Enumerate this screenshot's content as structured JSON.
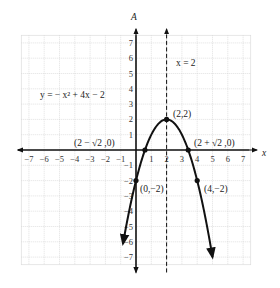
{
  "chart_data": {
    "type": "line",
    "title": "",
    "equation_label": "y = − x² + 4x − 2",
    "xlabel": "x",
    "ylabel": "A",
    "xlim": [
      -7.5,
      7.5
    ],
    "ylim": [
      -7.5,
      7.5
    ],
    "grid": true,
    "x_ticks": [
      -7,
      -6,
      -5,
      -4,
      -3,
      -2,
      -1,
      1,
      2,
      3,
      4,
      5,
      6,
      7
    ],
    "y_ticks": [
      -7,
      -6,
      -5,
      -4,
      -3,
      -2,
      -1,
      1,
      2,
      3,
      4,
      5,
      6,
      7
    ],
    "series": [
      {
        "name": "y = -x^2 + 4x - 2",
        "function": "-x^2+4x-2",
        "x_range": [
          -0.85,
          5.0
        ]
      }
    ],
    "axis_of_symmetry": {
      "label": "x = 2",
      "x": 2,
      "style": "dashed"
    },
    "points": [
      {
        "label": "(2,2)",
        "x": 2,
        "y": 2
      },
      {
        "label": "(2 − √2 ,0)",
        "x": 0.586,
        "y": 0
      },
      {
        "label": "(2 + √2 ,0)",
        "x": 3.414,
        "y": 0
      },
      {
        "label": "(0,−2)",
        "x": 0,
        "y": -2
      },
      {
        "label": "(4,−2)",
        "x": 4,
        "y": -2
      }
    ]
  },
  "labels": {
    "y_axis": "A",
    "x_axis": "x",
    "equation": "y = − x² + 4x − 2",
    "symmetry": "x = 2",
    "vertex": "(2,2)",
    "left_root": "(2 − √2 ,0)",
    "right_root": "(2 + √2 ,0)",
    "y_intercept": "(0,−2)",
    "mirror_point": "(4,−2)"
  }
}
